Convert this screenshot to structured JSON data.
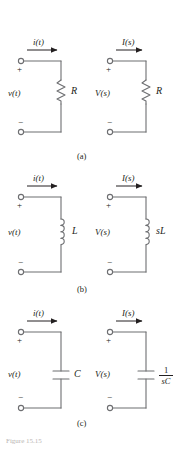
{
  "figure": {
    "caption": "Figure 15.15",
    "subcaptions": [
      {
        "id": "a",
        "label": "(a)"
      },
      {
        "id": "b",
        "label": "(b)"
      },
      {
        "id": "c",
        "label": "(c)"
      }
    ],
    "rows": [
      {
        "id": "resistor",
        "subcaption": "(a)",
        "time_domain": {
          "current_label": "i(t)",
          "voltage_label": "v(t)",
          "element_label": "R",
          "element_type": "resistor-symbol",
          "plus_sign": "+",
          "minus_sign": "−"
        },
        "s_domain": {
          "current_label": "I(s)",
          "voltage_label": "V(s)",
          "element_label": "R",
          "element_type": "resistor-symbol",
          "plus_sign": "+",
          "minus_sign": "−"
        }
      },
      {
        "id": "inductor",
        "subcaption": "(b)",
        "time_domain": {
          "current_label": "i(t)",
          "voltage_label": "v(t)",
          "element_label": "L",
          "element_type": "inductor-symbol",
          "plus_sign": "+",
          "minus_sign": "−"
        },
        "s_domain": {
          "current_label": "I(s)",
          "voltage_label": "V(s)",
          "element_label": "sL",
          "element_type": "inductor-symbol",
          "plus_sign": "+",
          "minus_sign": "−"
        }
      },
      {
        "id": "capacitor",
        "subcaption": "(c)",
        "time_domain": {
          "current_label": "i(t)",
          "voltage_label": "v(t)",
          "element_label": "C",
          "element_type": "capacitor-symbol",
          "plus_sign": "+",
          "minus_sign": "−"
        },
        "s_domain": {
          "current_label": "I(s)",
          "voltage_label": "V(s)",
          "element_label_numerator": "1",
          "element_label_denominator": "sC",
          "element_type": "capacitor-symbol",
          "plus_sign": "+",
          "minus_sign": "−"
        }
      }
    ],
    "colors": {
      "wire": "#6d6e71",
      "text": "#231f20",
      "background": "#ffffff",
      "caption": "#b9b5b3"
    }
  }
}
